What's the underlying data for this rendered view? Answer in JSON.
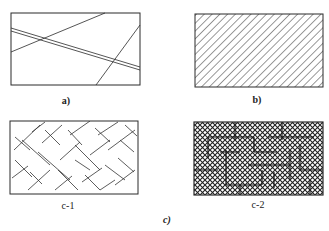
{
  "figure": {
    "panels": [
      {
        "id": "a",
        "label": "a)",
        "pattern": "random-lines",
        "description": "Rectangle with few random straight lines and one double line crossing diagonally"
      },
      {
        "id": "b",
        "label": "b)",
        "pattern": "parallel-diagonal-hatch",
        "description": "Rectangle filled with uniform parallel 45-degree hatching"
      },
      {
        "id": "c-1",
        "label": "c-1",
        "pattern": "short-crossed-segments",
        "description": "Rectangle with scattered short crossing line segments"
      },
      {
        "id": "c-2",
        "label": "c-2",
        "pattern": "dense-cross-hatch-with-grid",
        "description": "Rectangle with dense cross-hatching and overlaid rectilinear segments"
      }
    ],
    "group_label": "c)"
  },
  "colors": {
    "line": "#2a2a2a",
    "background": "#ffffff"
  }
}
